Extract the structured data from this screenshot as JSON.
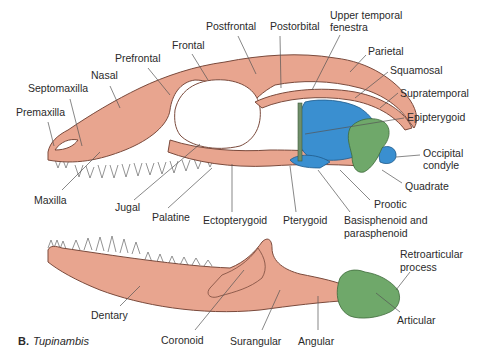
{
  "figure": {
    "panel_letter": "B.",
    "species": "Tupinambis"
  },
  "colors": {
    "dermal_bone": "#e8a58f",
    "dermal_bone_stroke": "#7a4a3c",
    "braincase_blue": "#3a8fd0",
    "quadrate_green": "#6fa86a",
    "epipterygoid_green": "#6f8f6a",
    "label_text": "#2a2a2a",
    "leader_line": "#555555"
  },
  "skull_labels": [
    {
      "id": "premaxilla",
      "text": "Premaxilla",
      "x": 16,
      "y": 112
    },
    {
      "id": "septomaxilla",
      "text": "Septomaxilla",
      "x": 28,
      "y": 88
    },
    {
      "id": "nasal",
      "text": "Nasal",
      "x": 91,
      "y": 75
    },
    {
      "id": "prefrontal",
      "text": "Prefrontal",
      "x": 115,
      "y": 56
    },
    {
      "id": "frontal",
      "text": "Frontal",
      "x": 172,
      "y": 43
    },
    {
      "id": "postfrontal",
      "text": "Postfrontal",
      "x": 206,
      "y": 24
    },
    {
      "id": "postorbital",
      "text": "Postorbital",
      "x": 270,
      "y": 24
    },
    {
      "id": "upper_temporal_fenestra_1",
      "text": "Upper temporal",
      "x": 330,
      "y": 13
    },
    {
      "id": "upper_temporal_fenestra_2",
      "text": "fenestra",
      "x": 330,
      "y": 25
    },
    {
      "id": "parietal",
      "text": "Parietal",
      "x": 368,
      "y": 46
    },
    {
      "id": "squamosal",
      "text": "Squamosal",
      "x": 390,
      "y": 65
    },
    {
      "id": "supratemporal",
      "text": "Supratemporal",
      "x": 400,
      "y": 88
    },
    {
      "id": "epipterygoid",
      "text": "Epipterygoid",
      "x": 407,
      "y": 112
    },
    {
      "id": "occipital_condyle_1",
      "text": "Occipital",
      "x": 423,
      "y": 145
    },
    {
      "id": "occipital_condyle_2",
      "text": "condyle",
      "x": 423,
      "y": 157
    },
    {
      "id": "quadrate",
      "text": "Quadrate",
      "x": 405,
      "y": 180
    },
    {
      "id": "prootic",
      "text": "Prootic",
      "x": 374,
      "y": 198
    },
    {
      "id": "basisphenoid_1",
      "text": "Basisphenoid and",
      "x": 344,
      "y": 214
    },
    {
      "id": "basisphenoid_2",
      "text": "parasphenoid",
      "x": 344,
      "y": 226
    },
    {
      "id": "pterygoid",
      "text": "Pterygoid",
      "x": 283,
      "y": 214
    },
    {
      "id": "ectopterygoid",
      "text": "Ectopterygoid",
      "x": 203,
      "y": 214
    },
    {
      "id": "palatine",
      "text": "Palatine",
      "x": 152,
      "y": 210
    },
    {
      "id": "jugal",
      "text": "Jugal",
      "x": 115,
      "y": 200
    },
    {
      "id": "maxilla",
      "text": "Maxilla",
      "x": 34,
      "y": 193
    }
  ],
  "mandible_labels": [
    {
      "id": "retroarticular_1",
      "text": "Retroarticular",
      "x": 400,
      "y": 250
    },
    {
      "id": "retroarticular_2",
      "text": "process",
      "x": 400,
      "y": 262
    },
    {
      "id": "articular",
      "text": "Articular",
      "x": 397,
      "y": 313
    },
    {
      "id": "angular",
      "text": "Angular",
      "x": 298,
      "y": 333
    },
    {
      "id": "surangular",
      "text": "Surangular",
      "x": 230,
      "y": 333
    },
    {
      "id": "coronoid",
      "text": "Coronoid",
      "x": 161,
      "y": 333
    },
    {
      "id": "dentary",
      "text": "Dentary",
      "x": 91,
      "y": 309
    }
  ]
}
